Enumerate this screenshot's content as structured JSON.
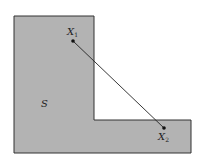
{
  "diagram": {
    "region_label": "S",
    "point1": {
      "label": "X",
      "subscript": "1"
    },
    "point2": {
      "label": "X",
      "subscript": "2"
    },
    "colors": {
      "fill": "#b3b3b3",
      "stroke": "#333333",
      "segment": "#222222"
    }
  }
}
